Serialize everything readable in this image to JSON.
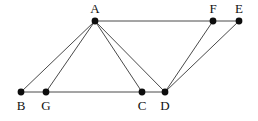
{
  "figure": {
    "width": 258,
    "height": 121,
    "background_color": "#ffffff",
    "edge_color": "#4a4a4a",
    "vertex_color": "#0d0d0d",
    "label_color": "#111111",
    "vertex_radius": 3.4,
    "edge_width": 1
  },
  "vertices": [
    {
      "id": "A",
      "label": "A",
      "x": 95,
      "y": 21,
      "label_x": 95,
      "label_y": 13,
      "label_position": "above"
    },
    {
      "id": "B",
      "label": "B",
      "x": 21,
      "y": 92,
      "label_x": 21,
      "label_y": 110,
      "label_position": "below"
    },
    {
      "id": "G",
      "label": "G",
      "x": 46,
      "y": 92,
      "label_x": 46,
      "label_y": 110,
      "label_position": "below"
    },
    {
      "id": "C",
      "label": "C",
      "x": 142,
      "y": 92,
      "label_x": 142,
      "label_y": 110,
      "label_position": "below"
    },
    {
      "id": "D",
      "label": "D",
      "x": 165,
      "y": 92,
      "label_x": 165,
      "label_y": 110,
      "label_position": "below"
    },
    {
      "id": "F",
      "label": "F",
      "x": 213,
      "y": 21,
      "label_x": 213,
      "label_y": 13,
      "label_position": "above"
    },
    {
      "id": "E",
      "label": "E",
      "x": 239,
      "y": 21,
      "label_x": 239,
      "label_y": 13,
      "label_position": "above"
    }
  ],
  "edges": [
    {
      "id": "A-B",
      "from": "A",
      "to": "B",
      "x1": 95,
      "y1": 21,
      "x2": 21,
      "y2": 92
    },
    {
      "id": "A-G",
      "from": "A",
      "to": "G",
      "x1": 95,
      "y1": 21,
      "x2": 46,
      "y2": 92
    },
    {
      "id": "A-C",
      "from": "A",
      "to": "C",
      "x1": 95,
      "y1": 21,
      "x2": 142,
      "y2": 92
    },
    {
      "id": "A-D",
      "from": "A",
      "to": "D",
      "x1": 95,
      "y1": 21,
      "x2": 165,
      "y2": 92
    },
    {
      "id": "A-F",
      "from": "A",
      "to": "F",
      "x1": 95,
      "y1": 21,
      "x2": 213,
      "y2": 21
    },
    {
      "id": "F-E",
      "from": "F",
      "to": "E",
      "x1": 213,
      "y1": 21,
      "x2": 239,
      "y2": 21
    },
    {
      "id": "B-G",
      "from": "B",
      "to": "G",
      "x1": 21,
      "y1": 92,
      "x2": 46,
      "y2": 92
    },
    {
      "id": "G-C",
      "from": "G",
      "to": "C",
      "x1": 46,
      "y1": 92,
      "x2": 142,
      "y2": 92
    },
    {
      "id": "C-D",
      "from": "C",
      "to": "D",
      "x1": 142,
      "y1": 92,
      "x2": 165,
      "y2": 92
    },
    {
      "id": "D-F",
      "from": "D",
      "to": "F",
      "x1": 165,
      "y1": 92,
      "x2": 213,
      "y2": 21
    },
    {
      "id": "D-E",
      "from": "D",
      "to": "E",
      "x1": 165,
      "y1": 92,
      "x2": 239,
      "y2": 21
    }
  ]
}
